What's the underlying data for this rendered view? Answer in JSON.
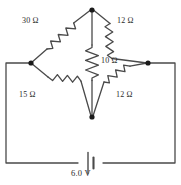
{
  "diagram": {
    "type": "wheatstone-bridge-circuit",
    "stroke_color": "#4a4a4a",
    "node_color": "#1a1a1a",
    "text_color": "#2b2b2b",
    "background": "#ffffff",
    "resistors": [
      {
        "id": "top-left",
        "label": "30 Ω",
        "value": 30,
        "unit": "ohm",
        "orientation": "diagonal"
      },
      {
        "id": "top-right",
        "label": "12 Ω",
        "value": 12,
        "unit": "ohm",
        "orientation": "diagonal"
      },
      {
        "id": "center",
        "label": "10 Ω",
        "value": 10,
        "unit": "ohm",
        "orientation": "vertical"
      },
      {
        "id": "bottom-left",
        "label": "15 Ω",
        "value": 15,
        "unit": "ohm",
        "orientation": "diagonal"
      },
      {
        "id": "bottom-right",
        "label": "12 Ω",
        "value": 12,
        "unit": "ohm",
        "orientation": "diagonal"
      }
    ],
    "source": {
      "id": "battery",
      "label": "6.0 V",
      "value": 6.0,
      "unit": "V",
      "symbol": "battery-cell"
    },
    "nodes": [
      {
        "id": "top",
        "x": 92,
        "y": 10
      },
      {
        "id": "left",
        "x": 31,
        "y": 63
      },
      {
        "id": "right",
        "x": 148,
        "y": 63
      },
      {
        "id": "bottom",
        "x": 92,
        "y": 117
      }
    ]
  }
}
